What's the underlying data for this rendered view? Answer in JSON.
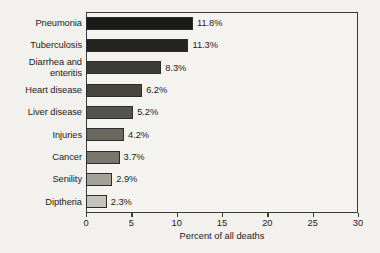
{
  "chart_data": {
    "type": "bar",
    "orientation": "horizontal",
    "title": "",
    "xlabel": "Percent of all deaths",
    "ylabel": "",
    "xlim": [
      0,
      30
    ],
    "xticks": [
      0,
      5,
      10,
      15,
      20,
      25,
      30
    ],
    "xtick_labels": [
      "0",
      "5",
      "10",
      "15",
      "20",
      "25",
      "30"
    ],
    "grid": false,
    "legend": null,
    "categories": [
      "Pneumonia",
      "Tuberculosis",
      "Diarrhea and enteritis",
      "Heart disease",
      "Liver disease",
      "Injuries",
      "Cancer",
      "Senility",
      "Diptheria"
    ],
    "values": [
      11.8,
      11.3,
      8.3,
      6.2,
      5.2,
      4.2,
      3.7,
      2.9,
      2.3
    ],
    "data_labels": [
      "11.8%",
      "11.3%",
      "8.3%",
      "6.2%",
      "5.2%",
      "4.2%",
      "3.7%",
      "2.9%",
      "2.3%"
    ],
    "bar_colors": [
      "#1a1a18",
      "#232321",
      "#3a3a38",
      "#46463f",
      "#555550",
      "#68685f",
      "#77776e",
      "#a3a39a",
      "#c3c3bb"
    ],
    "label_lines": [
      [
        "Pneumonia"
      ],
      [
        "Tuberculosis"
      ],
      [
        "Diarrhea and",
        "enteritis"
      ],
      [
        "Heart disease"
      ],
      [
        "Liver disease"
      ],
      [
        "Injuries"
      ],
      [
        "Cancer"
      ],
      [
        "Senility"
      ],
      [
        "Diptheria"
      ]
    ]
  },
  "style": {
    "background": "#f3f1ed",
    "plot_background": "#f5f3ef",
    "frame_color": "#3a3a38",
    "text_color": "#1b1b1b"
  }
}
